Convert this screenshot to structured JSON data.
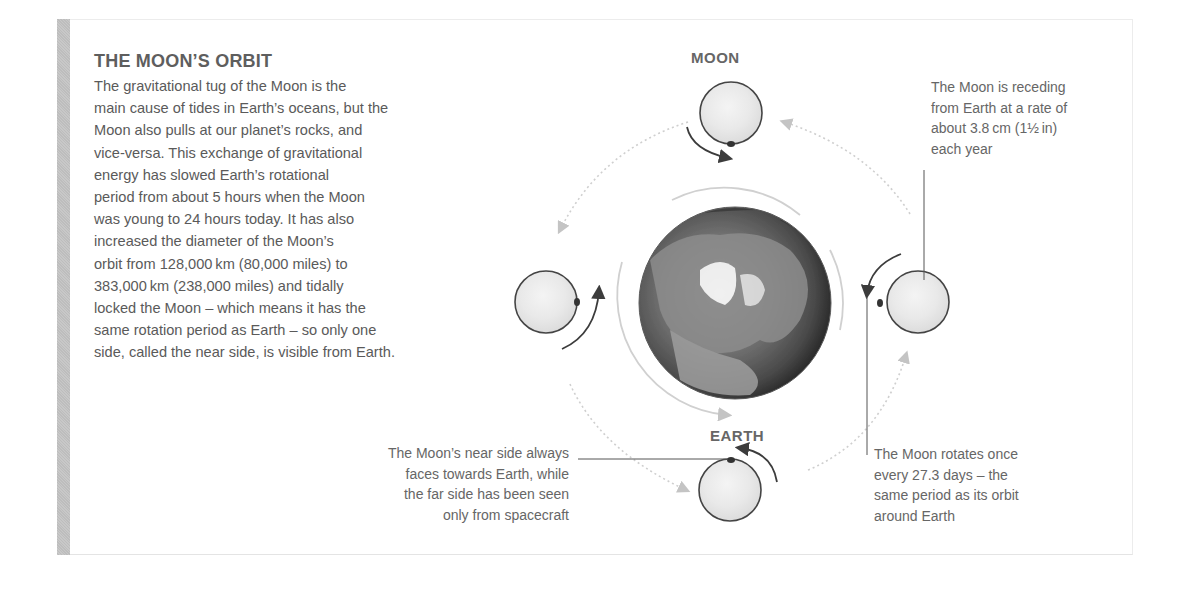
{
  "section": {
    "title": "THE MOON’S ORBIT",
    "body_lines": [
      "The gravitational tug of the Moon is the",
      "main cause of tides in Earth’s oceans, but the",
      "Moon also pulls at our planet’s rocks, and",
      "vice-versa. This exchange of gravitational",
      "energy has slowed Earth’s rotational",
      "period from about 5 hours when the Moon",
      "was young to 24 hours today. It has also",
      "increased the diameter of the Moon’s",
      "orbit from 128,000 km (80,000 miles) to",
      "383,000 km (238,000 miles) and tidally",
      "locked the Moon – which means it has the",
      "same rotation period as Earth – so only one",
      "side, called the near side, is visible from Earth."
    ]
  },
  "diagram": {
    "labels": {
      "moon": "MOON",
      "earth": "EARTH"
    },
    "callouts": {
      "receding": [
        "The Moon is receding",
        "from Earth at a rate of",
        "about 3.8 cm (1½ in)",
        "each year"
      ],
      "rotates": [
        "The Moon rotates once",
        "every 27.3 days – the",
        "same period as its orbit",
        "around Earth"
      ],
      "near_side": [
        "The Moon’s near side always",
        "faces towards Earth, while",
        "the far side has been seen",
        "only from spacecraft"
      ]
    },
    "colors": {
      "moon_outline": "#444444",
      "moon_fill": "#ebebeb",
      "orbit_dots": "#c8c8c8",
      "arrow": "#3c3c3c",
      "earth_ring": "#d4d4d4"
    }
  }
}
